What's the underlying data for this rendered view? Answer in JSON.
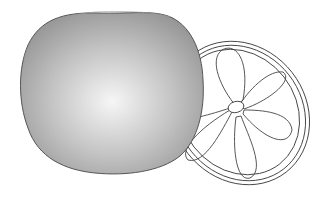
{
  "illustration": {
    "subject": "Citrus fruit with cut slice",
    "whole_fruit": {
      "label": "whole-fruit",
      "fill_light": "#f4f4f4",
      "fill_dark": "#9a9a9a",
      "outline": "#555555"
    },
    "slice": {
      "label": "fruit-slice",
      "segments": 5,
      "stroke": "#444444",
      "fill": "#ffffff"
    }
  }
}
